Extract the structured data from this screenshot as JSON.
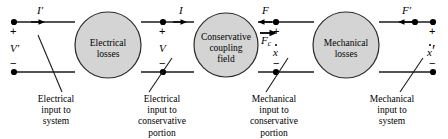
{
  "figure": {
    "type": "block-diagram",
    "line_color": "#1a1a1a",
    "block_fill": "#d4d4d4",
    "block_stroke": "#2b2b2b",
    "background": "#ffffff"
  },
  "blocks": [
    {
      "id": "electrical-losses",
      "line1": "Electrical",
      "line2": "losses",
      "cx": 108,
      "cy": 45,
      "r": 33
    },
    {
      "id": "conservative-coupling-field",
      "line1": "Conservative",
      "line2": "coupling",
      "line3": "field",
      "cx": 226,
      "cy": 45,
      "r": 32
    },
    {
      "id": "mechanical-losses",
      "line1": "Mechanical",
      "line2": "losses",
      "cx": 346,
      "cy": 45,
      "r": 33
    }
  ],
  "flow_labels": {
    "i_prime": "I",
    "i_prime_mark": "′",
    "i": "I",
    "force": "F",
    "force_c": "F",
    "force_c_sub": "c",
    "force_prime": "F",
    "force_prime_mark": "′"
  },
  "port_labels": {
    "v_prime": "V",
    "v_prime_mark": "′",
    "v": "V",
    "xdot": "x",
    "xdot_prime": "x",
    "xdot_prime_mark": "′",
    "plus": "+",
    "minus": "−"
  },
  "captions": [
    {
      "id": "electrical-input-to-system",
      "lines": [
        "Electrical",
        "input to",
        "system"
      ],
      "x": 16,
      "width": 80
    },
    {
      "id": "electrical-input-to-conservative-portion",
      "lines": [
        "Electrical",
        "input to",
        "conservative",
        "portion"
      ],
      "x": 116,
      "width": 92
    },
    {
      "id": "mechanical-input-to-conservative-portion",
      "lines": [
        "Mechanical",
        "input to",
        "conservative",
        "portion"
      ],
      "x": 228,
      "width": 92
    },
    {
      "id": "mechanical-input-to-system",
      "lines": [
        "Mechanical",
        "input to",
        "system"
      ],
      "x": 348,
      "width": 88
    }
  ]
}
